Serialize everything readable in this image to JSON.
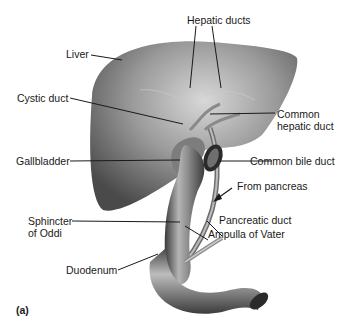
{
  "figure": {
    "panel_label": "(a)",
    "labels": {
      "hepatic_ducts": "Hepatic ducts",
      "liver": "Liver",
      "cystic_duct": "Cystic duct",
      "common_hepatic_duct_1": "Common",
      "common_hepatic_duct_2": "hepatic duct",
      "gallbladder": "Gallbladder",
      "common_bile_duct": "Common bile duct",
      "from_pancreas": "From pancreas",
      "pancreatic_duct": "Pancreatic duct",
      "sphincter_1": "Sphincter",
      "sphincter_2": "of Oddi",
      "ampulla": "Ampulla of Vater",
      "duodenum": "Duodenum"
    }
  }
}
